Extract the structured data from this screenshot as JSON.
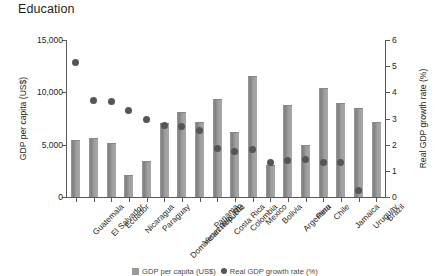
{
  "chart": {
    "title": "Education",
    "legend": {
      "bar_label": "GDP per capita (US$)",
      "dot_label": "Real GDP growth rate (%)"
    }
  },
  "chart_data": {
    "type": "bar",
    "title": "Education",
    "xlabel": "",
    "ylabel": "GDP per capita (US$)",
    "y2label": "Real GDP growth rate (%)",
    "ylim": [
      0,
      15000
    ],
    "y2lim": [
      0,
      6
    ],
    "yticks": [
      "0",
      "5,000",
      "10,000",
      "15,000"
    ],
    "y2ticks": [
      "0",
      "1",
      "2",
      "3",
      "4",
      "5",
      "6"
    ],
    "grid": false,
    "legend_position": "bottom",
    "categories": [
      "Guatemala",
      "El Salvador",
      "Ecuador",
      "Nicaragua",
      "Paraguay",
      "Dominican Republic",
      "Venezuela, RB",
      "Panama",
      "Costa Rica",
      "Colombia",
      "Mexico",
      "Bolivia",
      "Argentina",
      "Peru",
      "Chile",
      "Jamaica",
      "Uruguay",
      "Brazil"
    ],
    "series": [
      {
        "name": "GDP per capita (US$)",
        "type": "bar",
        "axis": "left",
        "values": [
          5450,
          5650,
          5150,
          2100,
          3450,
          7100,
          8100,
          7150,
          9400,
          6250,
          11600,
          3100,
          8800,
          5000,
          10400,
          8950,
          8500,
          7200
        ]
      },
      {
        "name": "Real GDP growth rate (%)",
        "type": "scatter",
        "axis": "right",
        "values": [
          5.15,
          3.7,
          3.65,
          3.3,
          2.95,
          2.75,
          2.7,
          2.55,
          1.85,
          1.75,
          1.8,
          1.3,
          1.4,
          1.45,
          1.3,
          1.3,
          0.25,
          null
        ]
      }
    ]
  }
}
